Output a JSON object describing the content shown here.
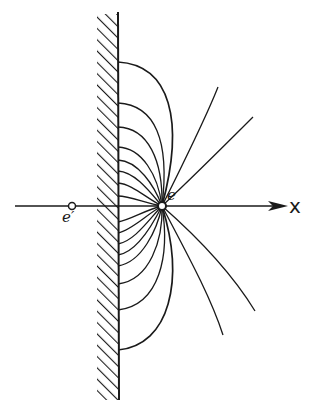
{
  "diagram": {
    "labels": {
      "charge": "e",
      "image_charge": "e′",
      "axis": "x"
    },
    "colors": {
      "line": "#1a1a1a",
      "background": "#ffffff"
    },
    "elements": {
      "conducting_wall": {
        "x": 118,
        "y_top": 12,
        "y_bottom": 400,
        "hatch_side": "left"
      },
      "charge": {
        "x": 162,
        "y": 206
      },
      "image_charge": {
        "x": 72,
        "y": 206
      },
      "axis": {
        "y": 206,
        "x_start": 15,
        "x_end": 288
      },
      "field_lines_to_wall_upper_y": [
        62,
        103,
        127,
        147,
        160,
        171,
        183,
        196
      ],
      "field_lines_to_wall_lower_y": [
        222,
        233,
        244,
        255,
        266,
        284,
        310,
        350
      ],
      "field_lines_outgoing_ends": [
        [
          218,
          87
        ],
        [
          253,
          117
        ],
        [
          255,
          311
        ],
        [
          223,
          335
        ]
      ]
    }
  }
}
